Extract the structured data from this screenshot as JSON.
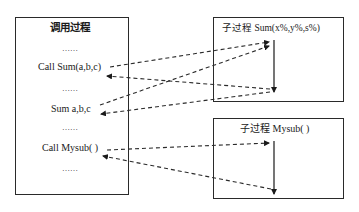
{
  "caller": {
    "title": "调用过程",
    "lines": [
      "……",
      "Call Sum(a,b,c)",
      "……",
      "Sum a,b,c",
      "……",
      "Call Mysub( )",
      "……"
    ]
  },
  "sub1": {
    "title": "子过程  Sum(x%,y%,s%)"
  },
  "sub2": {
    "title": "子过程  Mysub( )"
  },
  "arrows": [
    {
      "from": "Call Sum(a,b,c)",
      "to": "子过程 Sum start",
      "style": "dashed"
    },
    {
      "from": "子过程 Sum end",
      "to": "Call Sum(a,b,c)",
      "style": "dashed"
    },
    {
      "from": "Sum a,b,c",
      "to": "子过程 Sum start",
      "style": "dashed"
    },
    {
      "from": "子过程 Sum end",
      "to": "Sum a,b,c",
      "style": "dashed"
    },
    {
      "from": "Call Mysub( )",
      "to": "子过程 Mysub start",
      "style": "dashed"
    },
    {
      "from": "子过程 Mysub end",
      "to": "Call Mysub( )",
      "style": "dashed"
    }
  ]
}
